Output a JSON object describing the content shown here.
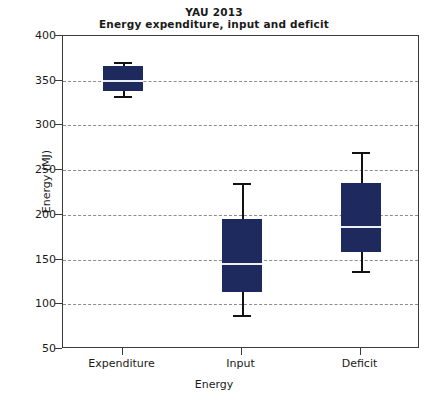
{
  "chart_data": {
    "type": "box",
    "title": "YAU 2013",
    "subtitle": "Energy expenditure, input and deficit",
    "xlabel": "Energy",
    "ylabel": "Energy (MJ)",
    "ylim": [
      50,
      400
    ],
    "ytick_labels": [
      "400",
      "350",
      "300",
      "250",
      "200",
      "150",
      "100",
      "50"
    ],
    "ytick_values": [
      400,
      350,
      300,
      250,
      200,
      150,
      100,
      50
    ],
    "grid": "horizontal-dashed",
    "legend": "none",
    "categories": [
      "Expenditure",
      "Input",
      "Deficit"
    ],
    "boxes": [
      {
        "category": "Expenditure",
        "whisker_low": 333,
        "q1": 338,
        "median": 351,
        "q3": 366,
        "whisker_high": 371
      },
      {
        "category": "Input",
        "whisker_low": 88,
        "q1": 114,
        "median": 146,
        "q3": 195,
        "whisker_high": 236
      },
      {
        "category": "Deficit",
        "whisker_low": 137,
        "q1": 158,
        "median": 188,
        "q3": 236,
        "whisker_high": 270
      }
    ],
    "colors": {
      "box_fill": "#1e2a5e",
      "median": "#eef0f7",
      "whisker": "#121212",
      "grid": "#8c8c8c",
      "axis": "#3a3a3a",
      "text": "#1a1a1a",
      "background": "#ffffff"
    }
  }
}
